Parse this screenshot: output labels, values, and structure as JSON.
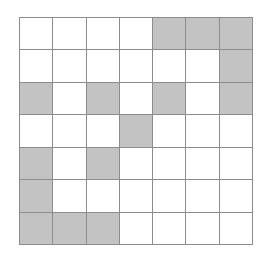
{
  "figure": {
    "type": "grid-pattern",
    "rows": 7,
    "columns": 7,
    "colors": {
      "filled": "#c3c3c3",
      "empty": "#ffffff",
      "gridline": "#8c8c8c",
      "background": "#ffffff"
    },
    "cells": [
      [
        0,
        0,
        0,
        0,
        1,
        1,
        1
      ],
      [
        0,
        0,
        0,
        0,
        0,
        0,
        1
      ],
      [
        1,
        0,
        1,
        0,
        1,
        0,
        1
      ],
      [
        0,
        0,
        0,
        1,
        0,
        0,
        0
      ],
      [
        1,
        0,
        1,
        0,
        0,
        0,
        0
      ],
      [
        1,
        0,
        0,
        0,
        0,
        0,
        0
      ],
      [
        1,
        1,
        1,
        0,
        0,
        0,
        0
      ]
    ],
    "filled_count": 16,
    "total_count": 49
  }
}
